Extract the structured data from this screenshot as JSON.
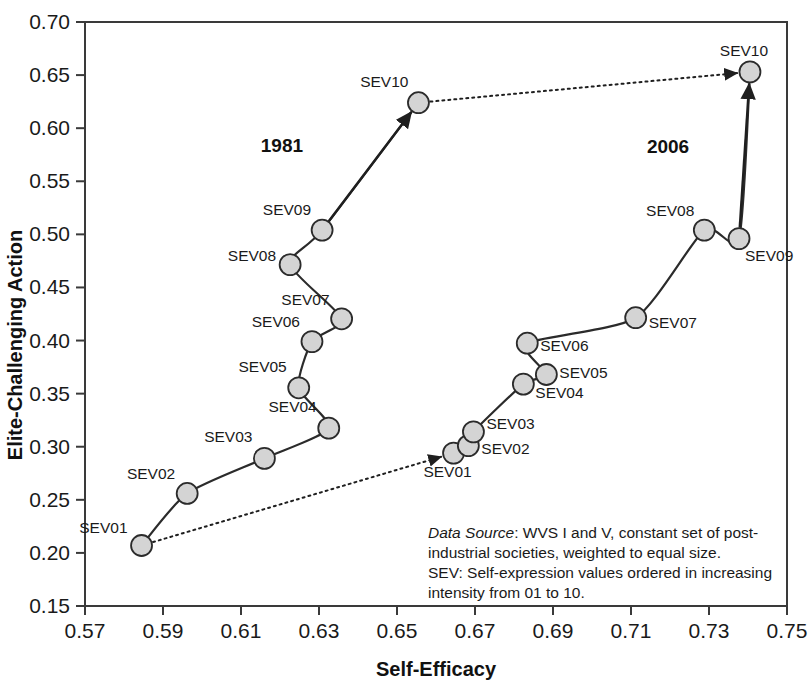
{
  "chart_data": {
    "type": "line",
    "title": "",
    "xlabel": "Self-Efficacy",
    "ylabel": "Elite-Challenging Action",
    "xlim": [
      0.57,
      0.75
    ],
    "ylim": [
      0.15,
      0.7
    ],
    "xticks": [
      "0.57",
      "0.59",
      "0.61",
      "0.63",
      "0.65",
      "0.67",
      "0.69",
      "0.71",
      "0.73",
      "0.75"
    ],
    "xtick_values": [
      0.57,
      0.59,
      0.61,
      0.63,
      0.65,
      0.67,
      0.69,
      0.71,
      0.73,
      0.75
    ],
    "yticks": [
      "0.70",
      "0.65",
      "0.60",
      "0.55",
      "0.50",
      "0.45",
      "0.40",
      "0.35",
      "0.30",
      "0.25",
      "0.20",
      "0.15"
    ],
    "ytick_values": [
      0.7,
      0.65,
      0.6,
      0.55,
      0.5,
      0.45,
      0.4,
      0.35,
      0.3,
      0.25,
      0.2,
      0.15
    ],
    "grid": false,
    "legend_position": "inline-annotation",
    "marker_fill": "#d4d4d4",
    "marker_stroke": "#2b2b2b",
    "line_color": "#2b2b2b",
    "series": [
      {
        "name": "1981",
        "label_x": 0.6205,
        "label_y": 0.578,
        "point_labels": [
          "SEV01",
          "SEV02",
          "SEV03",
          "SEV04",
          "SEV05",
          "SEV06",
          "SEV07",
          "SEV08",
          "SEV09",
          "SEV10"
        ],
        "x": [
          0.5845,
          0.5962,
          0.616,
          0.6325,
          0.6248,
          0.6282,
          0.6358,
          0.6226,
          0.6308,
          0.6555
        ],
        "y": [
          0.207,
          0.256,
          0.289,
          0.3175,
          0.3555,
          0.399,
          0.4205,
          0.4715,
          0.504,
          0.624
        ]
      },
      {
        "name": "2006",
        "label_x": 0.7195,
        "label_y": 0.577,
        "point_labels": [
          "SEV01",
          "SEV02",
          "SEV03",
          "SEV04",
          "SEV05",
          "SEV06",
          "SEV07",
          "SEV08",
          "SEV09",
          "SEV10"
        ],
        "x": [
          0.6645,
          0.6683,
          0.6696,
          0.6824,
          0.6883,
          0.6834,
          0.7112,
          0.7288,
          0.7377,
          0.7405
        ],
        "y": [
          0.294,
          0.301,
          0.314,
          0.359,
          0.368,
          0.3975,
          0.4215,
          0.504,
          0.496,
          0.653
        ]
      }
    ],
    "transition_arrows": [
      {
        "name": "sev01-transition",
        "from_x": 0.5845,
        "from_y": 0.207,
        "to_x": 0.6645,
        "to_y": 0.294,
        "style": "dotted"
      },
      {
        "name": "sev10-transition",
        "from_x": 0.6555,
        "from_y": 0.624,
        "to_x": 0.7405,
        "to_y": 0.653,
        "style": "dotted"
      }
    ],
    "annotations": [
      "Data Source: WVS I and V, constant set of post-industrial societies, weighted to equal size.",
      "SEV: Self-expression values ordered in increasing intensity from 01 to 10."
    ]
  },
  "note": {
    "line1_em": "Data Source",
    "line1_rest": ": WVS I and V, constant set of post-",
    "line2": "industrial societies, weighted to equal size.",
    "line3": "SEV: Self-expression values ordered in increasing",
    "line4": "intensity from 01 to 10."
  }
}
